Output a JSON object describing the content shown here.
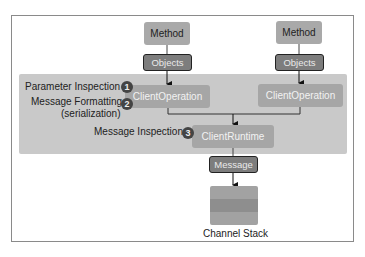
{
  "diagram": {
    "left_path": {
      "method": "Method",
      "objects": "Objects",
      "operation": "ClientOperation"
    },
    "right_path": {
      "method": "Method",
      "objects": "Objects",
      "operation": "ClientOperation"
    },
    "runtime": "ClientRuntime",
    "message": "Message",
    "channel_stack_label": "Channel Stack",
    "steps": [
      {
        "number": "1",
        "label": "Parameter Inspection"
      },
      {
        "number": "2",
        "label": "Message Formatting",
        "sublabel": "(serialization)"
      },
      {
        "number": "3",
        "label": "Message Inspection"
      }
    ]
  }
}
